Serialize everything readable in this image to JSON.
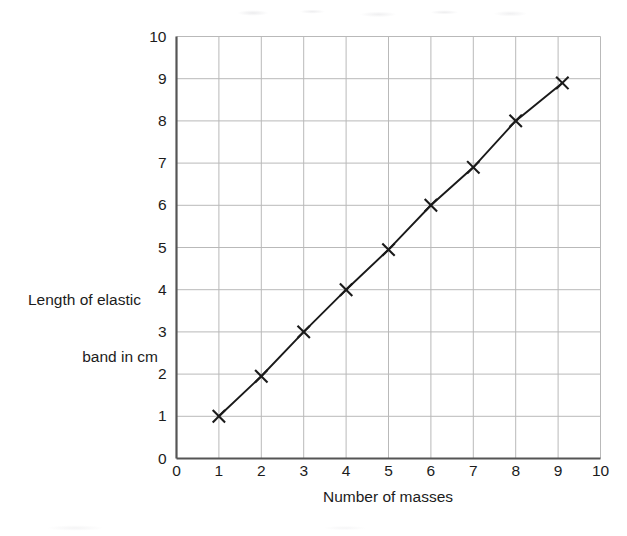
{
  "chart_data": {
    "type": "line",
    "title": "",
    "xlabel": "Number of masses",
    "ylabel": "Length of elastic band in cm",
    "ylabel_lines": [
      "Length of elastic",
      "band in cm"
    ],
    "xlim": [
      0,
      10
    ],
    "ylim": [
      0,
      10
    ],
    "x_ticks": [
      0,
      1,
      2,
      3,
      4,
      5,
      6,
      7,
      8,
      9,
      10
    ],
    "y_ticks": [
      0,
      1,
      2,
      3,
      4,
      5,
      6,
      7,
      8,
      9,
      10
    ],
    "grid": true,
    "legend": "none",
    "marker": "x-cross",
    "series": [
      {
        "name": "Length of elastic band",
        "x": [
          1,
          2,
          3,
          4,
          5,
          6,
          7,
          8,
          9.1
        ],
        "y": [
          1,
          1.95,
          3,
          4,
          4.95,
          6,
          6.9,
          8,
          8.9
        ],
        "points": [
          {
            "x": 1,
            "y": 1
          },
          {
            "x": 2,
            "y": 1.95
          },
          {
            "x": 3,
            "y": 3
          },
          {
            "x": 4,
            "y": 4
          },
          {
            "x": 5,
            "y": 4.95
          },
          {
            "x": 6,
            "y": 6
          },
          {
            "x": 7,
            "y": 6.9
          },
          {
            "x": 8,
            "y": 8
          },
          {
            "x": 9.1,
            "y": 8.9
          }
        ],
        "line_color": "#1a1a1a",
        "marker_color": "#1a1a1a"
      }
    ],
    "colors": {
      "background": "#ffffff",
      "grid": "#b9b9b9",
      "axis": "#555555",
      "text": "#1c1c1c",
      "line": "#1a1a1a"
    }
  },
  "axis_titles": {
    "y_line1": "Length of elastic",
    "y_line2": "band in cm",
    "x": "Number of masses"
  },
  "x_tick_labels": [
    "0",
    "1",
    "2",
    "3",
    "4",
    "5",
    "6",
    "7",
    "8",
    "9",
    "10"
  ],
  "y_tick_labels": [
    "0",
    "1",
    "2",
    "3",
    "4",
    "5",
    "6",
    "7",
    "8",
    "9",
    "10"
  ]
}
